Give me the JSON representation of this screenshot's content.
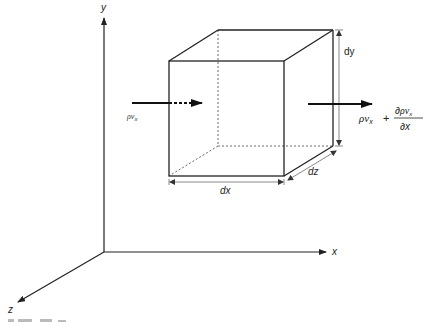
{
  "diagram": {
    "type": "control-volume-mass-flux",
    "axes": {
      "x_label": "x",
      "y_label": "y",
      "z_label": "z"
    },
    "dimensions": {
      "dx": "dx",
      "dy": "dy",
      "dz": "dz"
    },
    "inflow": {
      "rho": "ρ",
      "v": "v",
      "sub": "x"
    },
    "outflow": {
      "rho": "ρ",
      "v": "v",
      "sub": "x",
      "plus": "+",
      "partial": "∂",
      "den_var": "x"
    },
    "colors": {
      "line": "#222222",
      "dim_line": "#555555",
      "background": "#ffffff"
    }
  }
}
